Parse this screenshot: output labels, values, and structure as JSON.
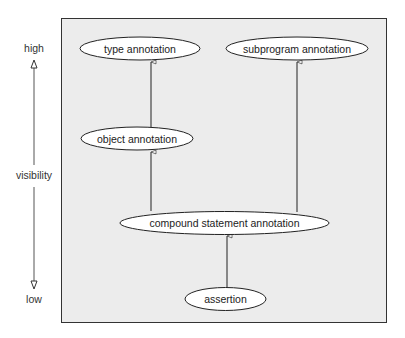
{
  "diagram": {
    "axis": {
      "top_label": "high",
      "middle_label": "visibility",
      "bottom_label": "low"
    },
    "nodes": [
      {
        "id": "type",
        "label": "type annotation"
      },
      {
        "id": "subprogram",
        "label": "subprogram annotation"
      },
      {
        "id": "object",
        "label": "object annotation"
      },
      {
        "id": "compound",
        "label": "compound statement annotation"
      },
      {
        "id": "assertion",
        "label": "assertion"
      }
    ],
    "edges": [
      {
        "from": "object",
        "to": "type"
      },
      {
        "from": "compound",
        "to": "object"
      },
      {
        "from": "compound",
        "to": "subprogram"
      },
      {
        "from": "assertion",
        "to": "compound"
      }
    ],
    "colors": {
      "panel_background": "#ececec",
      "panel_border": "#333333",
      "node_fill": "#ffffff",
      "stroke": "#222222"
    }
  }
}
